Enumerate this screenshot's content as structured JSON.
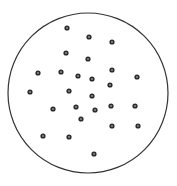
{
  "diagram": {
    "boundary": {
      "shape": "circle",
      "cx": 88,
      "cy": 93,
      "r": 80,
      "stroke": "#333333",
      "stroke_width": 1.2,
      "fill": "#ffffff"
    },
    "dot_style": {
      "r": 2.6,
      "ring_color": "#2b2b2b",
      "center_color": "#9a9a9a",
      "center_r": 0.9
    },
    "dots": [
      [
        67,
        28
      ],
      [
        89,
        37
      ],
      [
        112,
        42
      ],
      [
        66,
        53
      ],
      [
        88,
        59
      ],
      [
        38,
        73
      ],
      [
        61,
        72
      ],
      [
        78,
        76
      ],
      [
        92,
        79
      ],
      [
        112,
        70
      ],
      [
        137,
        77
      ],
      [
        110,
        85
      ],
      [
        30,
        92
      ],
      [
        69,
        91
      ],
      [
        92,
        96
      ],
      [
        53,
        109
      ],
      [
        76,
        107
      ],
      [
        95,
        110
      ],
      [
        111,
        106
      ],
      [
        135,
        106
      ],
      [
        81,
        119
      ],
      [
        112,
        126
      ],
      [
        138,
        126
      ],
      [
        43,
        136
      ],
      [
        69,
        137
      ],
      [
        94,
        154
      ]
    ],
    "dot_count": 26
  }
}
